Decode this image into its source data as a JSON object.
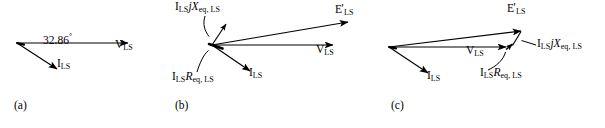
{
  "figure": {
    "type": "phasor-diagram",
    "background_color": "#ffffff",
    "stroke_color": "#000000",
    "width": 605,
    "height": 128
  },
  "panels": [
    {
      "id": "a",
      "caption": "(a)",
      "caption_pos": {
        "x": 14,
        "y": 99
      },
      "origin": {
        "x": 17,
        "y": 43
      },
      "vectors": [
        {
          "name": "V_LS",
          "label_main": "V",
          "label_sub": "LS",
          "prime": false,
          "from": {
            "x": 17,
            "y": 43
          },
          "to": {
            "x": 128,
            "y": 43
          },
          "label_pos": {
            "x": 116,
            "y": 45
          }
        },
        {
          "name": "I_LS",
          "label_main": "I",
          "label_sub": "LS",
          "prime": false,
          "from": {
            "x": 17,
            "y": 43
          },
          "to": {
            "x": 57,
            "y": 69
          },
          "label_pos": {
            "x": 58,
            "y": 64
          }
        }
      ],
      "annotations": [
        {
          "name": "power-factor-angle",
          "text": "32.86",
          "symbol": "°",
          "pos": {
            "x": 44,
            "y": 39
          }
        }
      ]
    },
    {
      "id": "b",
      "caption": "(b)",
      "caption_pos": {
        "x": 175,
        "y": 99
      },
      "origin": {
        "x": 212,
        "y": 45
      },
      "vectors": [
        {
          "name": "E_prime_LS",
          "label_main": "E",
          "label_sub": "LS",
          "prime": true,
          "from": {
            "x": 212,
            "y": 45
          },
          "to": {
            "x": 348,
            "y": 22
          },
          "label_pos": {
            "x": 337,
            "y": 9
          }
        },
        {
          "name": "V_LS",
          "label_main": "V",
          "label_sub": "LS",
          "prime": false,
          "from": {
            "x": 212,
            "y": 45
          },
          "to": {
            "x": 333,
            "y": 45
          },
          "label_pos": {
            "x": 318,
            "y": 50
          }
        },
        {
          "name": "I_LS",
          "label_main": "I",
          "label_sub": "LS",
          "prime": false,
          "from": {
            "x": 212,
            "y": 45
          },
          "to": {
            "x": 250,
            "y": 71
          },
          "label_pos": {
            "x": 250,
            "y": 73
          }
        },
        {
          "name": "I_LS_jX_eq_LS",
          "label_main": "I",
          "label_sub": "LS",
          "label_tail_italic_1": "j",
          "label_tail_italic_2": "X",
          "label_tail_sub": "eq, LS",
          "from": {
            "x": 212,
            "y": 45
          },
          "to": {
            "x": 226,
            "y": 24
          },
          "label_pos": {
            "x": 177,
            "y": 3
          }
        },
        {
          "name": "I_LS_R_eq_LS",
          "label_main": "I",
          "label_sub": "LS",
          "label_tail_italic_1": "R",
          "label_tail_sub": "eq, LS",
          "from": {
            "x": 212,
            "y": 45
          },
          "to": {
            "x": 222,
            "y": 48
          },
          "label_pos": {
            "x": 173,
            "y": 76
          }
        }
      ],
      "leaders": [
        {
          "name": "leader-x-drop",
          "path": "M 205 16 C 203 24, 205 30, 209 36"
        },
        {
          "name": "leader-r-drop",
          "path": "M 198 72 C 200 64, 203 55, 209 50"
        }
      ]
    },
    {
      "id": "c",
      "caption": "(c)",
      "caption_pos": {
        "x": 391,
        "y": 99
      },
      "origin": {
        "x": 389,
        "y": 47
      },
      "vectors": [
        {
          "name": "E_prime_LS",
          "label_main": "E",
          "label_sub": "LS",
          "prime": true,
          "from": {
            "x": 389,
            "y": 47
          },
          "to": {
            "x": 521,
            "y": 31
          },
          "label_pos": {
            "x": 508,
            "y": 7
          }
        },
        {
          "name": "V_LS",
          "label_main": "V",
          "label_sub": "LS",
          "prime": false,
          "from": {
            "x": 389,
            "y": 47
          },
          "to": {
            "x": 506,
            "y": 47
          },
          "label_pos": {
            "x": 468,
            "y": 51
          }
        },
        {
          "name": "I_LS",
          "label_main": "I",
          "label_sub": "LS",
          "prime": false,
          "from": {
            "x": 389,
            "y": 47
          },
          "to": {
            "x": 428,
            "y": 73
          },
          "label_pos": {
            "x": 428,
            "y": 76
          }
        },
        {
          "name": "I_LS_R_eq_LS",
          "label_main": "I",
          "label_sub": "LS",
          "label_tail_italic_1": "R",
          "label_tail_sub": "eq, LS",
          "from": {
            "x": 506,
            "y": 47
          },
          "to": {
            "x": 513,
            "y": 45
          },
          "label_pos": {
            "x": 481,
            "y": 73
          }
        },
        {
          "name": "I_LS_jX_eq_LS",
          "label_main": "I",
          "label_sub": "LS",
          "label_tail_italic_1": "j",
          "label_tail_italic_2": "X",
          "label_tail_sub": "eq, LS",
          "from": {
            "x": 513,
            "y": 45
          },
          "to": {
            "x": 521,
            "y": 31
          },
          "label_pos": {
            "x": 538,
            "y": 41
          }
        }
      ],
      "leaders": [
        {
          "name": "leader-x-drop",
          "path": "M 535 45 L 521 41"
        },
        {
          "name": "leader-r-drop",
          "path": "M 489 70 C 496 66, 503 60, 505 52"
        }
      ]
    }
  ]
}
